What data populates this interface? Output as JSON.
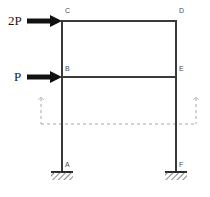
{
  "figure": {
    "type": "structural-frame-diagram",
    "background_color": "#ffffff",
    "member_color": "#3a3a3a",
    "load_color": "#111111",
    "dashed_color": "#9a9a9a",
    "label_color": "#4a4a4a"
  },
  "loads": [
    {
      "id": "load-2p",
      "label": "2P",
      "applied_at_node": "C",
      "direction": "right",
      "arrow_start_x": 27,
      "arrow_end_x": 61,
      "arrow_y": 21,
      "label_x": 8,
      "label_y": 25
    },
    {
      "id": "load-p",
      "label": "P",
      "applied_at_node": "B",
      "direction": "right",
      "arrow_start_x": 27,
      "arrow_end_x": 61,
      "arrow_y": 77,
      "label_x": 14,
      "label_y": 81
    }
  ],
  "nodes": [
    {
      "id": "C",
      "label": "C",
      "x": 62,
      "y": 21,
      "label_x": 65,
      "label_y": 13
    },
    {
      "id": "D",
      "label": "D",
      "x": 176,
      "y": 21,
      "label_x": 179,
      "label_y": 13
    },
    {
      "id": "B",
      "label": "B",
      "x": 62,
      "y": 77,
      "label_x": 65,
      "label_y": 71
    },
    {
      "id": "E",
      "label": "E",
      "x": 176,
      "y": 77,
      "label_x": 179,
      "label_y": 71
    },
    {
      "id": "A",
      "label": "A",
      "x": 62,
      "y": 172,
      "label_x": 65,
      "label_y": 167
    },
    {
      "id": "F",
      "label": "F",
      "x": 176,
      "y": 172,
      "label_x": 179,
      "label_y": 167
    }
  ],
  "members": [
    {
      "id": "beam-CD",
      "from": "C",
      "to": "D",
      "orientation": "horizontal"
    },
    {
      "id": "beam-BE",
      "from": "B",
      "to": "E",
      "orientation": "horizontal"
    },
    {
      "id": "column-AC",
      "from": "A",
      "to": "C",
      "orientation": "vertical"
    },
    {
      "id": "column-DF",
      "from": "D",
      "to": "F",
      "orientation": "vertical"
    }
  ],
  "supports": [
    {
      "id": "support-A",
      "node": "A",
      "kind": "fixed",
      "x": 62,
      "y": 172,
      "width": 22,
      "hatch_height": 8
    },
    {
      "id": "support-F",
      "node": "F",
      "kind": "fixed",
      "x": 176,
      "y": 172,
      "width": 22,
      "hatch_height": 8
    }
  ],
  "reference_outline": {
    "id": "dashed-reference",
    "style": "dashed",
    "left_x": 41,
    "right_x": 196,
    "top_y": 98,
    "bottom_y": 124
  }
}
